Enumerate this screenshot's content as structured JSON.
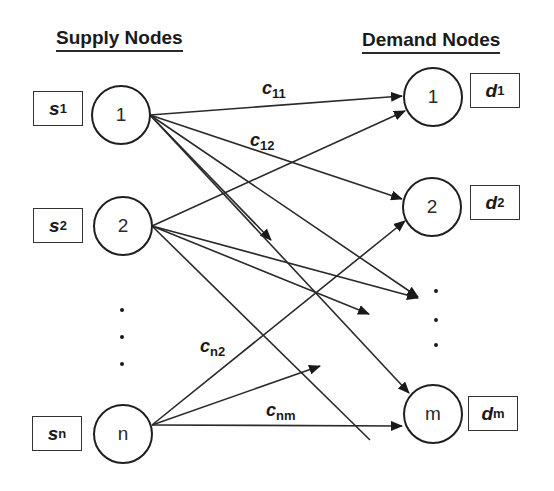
{
  "headings": {
    "supply": "Supply Nodes",
    "demand": "Demand Nodes"
  },
  "supply_nodes": [
    {
      "label": "1",
      "supply_var": "s",
      "supply_sub": "1"
    },
    {
      "label": "2",
      "supply_var": "s",
      "supply_sub": "2"
    },
    {
      "label": "n",
      "supply_var": "s",
      "supply_sub": "n"
    }
  ],
  "demand_nodes": [
    {
      "label": "1",
      "demand_var": "d",
      "demand_sub": "1"
    },
    {
      "label": "2",
      "demand_var": "d",
      "demand_sub": "2"
    },
    {
      "label": "m",
      "demand_var": "d",
      "demand_sub": "m"
    }
  ],
  "cost_labels": [
    {
      "var": "c",
      "sub": "11"
    },
    {
      "var": "c",
      "sub": "12"
    },
    {
      "var": "c",
      "sub": "n2"
    },
    {
      "var": "c",
      "sub": "nm"
    }
  ],
  "ellipsis": {
    "supply": "...",
    "demand": "..."
  },
  "colors": {
    "line": "#2a2a2a",
    "background": "#ffffff"
  }
}
